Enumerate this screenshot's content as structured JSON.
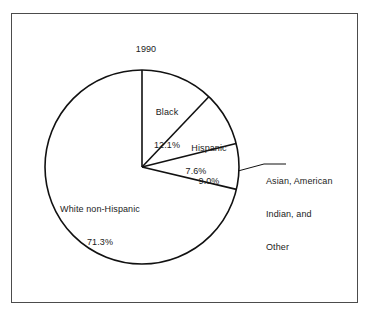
{
  "figure": {
    "title": "1990",
    "frame_color": "#4c4c4c",
    "stroke_color": "#111111",
    "background": "#ffffff"
  },
  "callout": {
    "line1": "Asian, American",
    "line2": "Indian, and",
    "line3": "Other"
  },
  "labels": {
    "black_name": "Black",
    "black_pct": "12.1%",
    "hispanic_name": "Hispanic",
    "hispanic_pct": "9.0%",
    "other_pct": "7.6%",
    "white_name": "White non-Hispanic",
    "white_pct": "71.3%"
  },
  "chart_data": {
    "type": "pie",
    "title": "1990",
    "xlabel": "",
    "ylabel": "",
    "legend_position": "none",
    "grid": false,
    "start_angle_deg": 90,
    "direction": "clockwise",
    "categories": [
      "Black",
      "Hispanic",
      "Asian, American Indian, and Other",
      "White non-Hispanic"
    ],
    "values": [
      12.1,
      9.0,
      7.6,
      71.3
    ],
    "value_labels": [
      "12.1%",
      "9.0%",
      "7.6%",
      "71.3%"
    ],
    "units": "percent",
    "slices": [
      {
        "name": "Black",
        "value": 12.1,
        "label": "Black",
        "value_label": "12.1%",
        "fill": "#ffffff",
        "stroke": "#111111",
        "label_placement": "inside"
      },
      {
        "name": "Hispanic",
        "value": 9.0,
        "label": "Hispanic",
        "value_label": "9.0%",
        "fill": "#ffffff",
        "stroke": "#111111",
        "label_placement": "inside"
      },
      {
        "name": "Asian, American Indian, and Other",
        "value": 7.6,
        "label": "Asian, American Indian, and Other",
        "value_label": "7.6%",
        "fill": "#ffffff",
        "stroke": "#111111",
        "label_placement": "callout"
      },
      {
        "name": "White non-Hispanic",
        "value": 71.3,
        "label": "White non-Hispanic",
        "value_label": "71.3%",
        "fill": "#ffffff",
        "stroke": "#111111",
        "label_placement": "inside"
      }
    ],
    "total": 100.0
  }
}
